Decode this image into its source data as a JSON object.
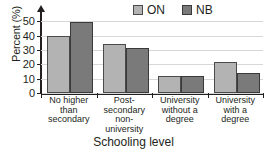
{
  "chart_data": {
    "type": "bar",
    "title": "",
    "xlabel": "Schooling level",
    "ylabel": "Percent (%)",
    "categories": [
      "No higher than secondary",
      "Post-secondary non-university",
      "University without a degree",
      "University with a degree"
    ],
    "category_lines": [
      [
        "No higher",
        "than",
        "secondary"
      ],
      [
        "Post-",
        "secondary",
        "non-",
        "university"
      ],
      [
        "University",
        "without a",
        "degree"
      ],
      [
        "University",
        "with a",
        "degree"
      ]
    ],
    "series": [
      {
        "name": "ON",
        "color": "#b3b3b3",
        "values": [
          40,
          34,
          12,
          21.5
        ]
      },
      {
        "name": "NB",
        "color": "#7a7a7a",
        "values": [
          49.5,
          31.5,
          11.5,
          14
        ]
      }
    ],
    "ylim": [
      0,
      55
    ],
    "yticks": [
      0,
      10,
      20,
      30,
      40,
      50
    ],
    "ytick_labels": [
      "0",
      "10",
      "20",
      "30",
      "40",
      "50"
    ],
    "grid": true,
    "legend_position": "top-right",
    "axis_color": "#231f20",
    "grid_color": "#d7d7d7"
  },
  "legend": {
    "items": [
      {
        "label": "ON"
      },
      {
        "label": "NB"
      }
    ]
  },
  "clipped_title": ""
}
